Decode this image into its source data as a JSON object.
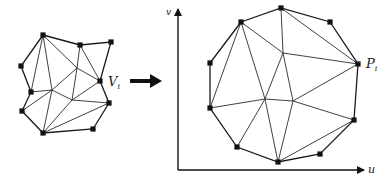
{
  "figure": {
    "left_mesh": {
      "label": "V",
      "label_sub": "i",
      "vertices": {
        "A": [
          43,
          35
        ],
        "B": [
          80,
          45
        ],
        "C": [
          111,
          42
        ],
        "D": [
          21,
          66
        ],
        "E": [
          100,
          81
        ],
        "F": [
          31,
          92
        ],
        "G": [
          22,
          111
        ],
        "H": [
          109,
          103
        ],
        "I": [
          43,
          133
        ],
        "J": [
          93,
          129
        ]
      },
      "interior": {
        "L": [
          77,
          68
        ],
        "K": [
          52,
          90
        ],
        "M": [
          72,
          100
        ]
      },
      "boundary": [
        "A",
        "B",
        "C",
        "E",
        "H",
        "J",
        "I",
        "G",
        "F",
        "D",
        "A"
      ],
      "edges": [
        [
          "A",
          "F"
        ],
        [
          "A",
          "K"
        ],
        [
          "A",
          "L"
        ],
        [
          "L",
          "E"
        ],
        [
          "B",
          "L"
        ],
        [
          "B",
          "E"
        ],
        [
          "L",
          "K"
        ],
        [
          "L",
          "M"
        ],
        [
          "K",
          "M"
        ],
        [
          "M",
          "E"
        ],
        [
          "M",
          "H"
        ],
        [
          "F",
          "K"
        ],
        [
          "G",
          "K"
        ],
        [
          "K",
          "I"
        ],
        [
          "M",
          "I"
        ],
        [
          "I",
          "H"
        ]
      ],
      "labeled_vertex": "E"
    },
    "arrow": {
      "from": [
        130,
        81
      ],
      "to": [
        161,
        81
      ]
    },
    "right_mesh": {
      "label": "P",
      "label_sub": "i",
      "vertices": {
        "A": [
          241,
          22
        ],
        "B": [
          281,
          8
        ],
        "C": [
          330,
          22
        ],
        "P": [
          358,
          64
        ],
        "D": [
          210,
          63
        ],
        "F": [
          210,
          108
        ],
        "H": [
          354,
          120
        ],
        "G": [
          237,
          147
        ],
        "I": [
          278,
          162
        ],
        "J": [
          320,
          154
        ]
      },
      "interior": {
        "L": [
          283,
          53
        ],
        "K": [
          265,
          99
        ],
        "M": [
          293,
          101
        ]
      },
      "boundary": [
        "A",
        "B",
        "C",
        "P",
        "H",
        "J",
        "I",
        "G",
        "F",
        "D",
        "A"
      ],
      "edges": [
        [
          "A",
          "F"
        ],
        [
          "A",
          "K"
        ],
        [
          "A",
          "L"
        ],
        [
          "L",
          "P"
        ],
        [
          "B",
          "L"
        ],
        [
          "B",
          "P"
        ],
        [
          "L",
          "K"
        ],
        [
          "L",
          "M"
        ],
        [
          "K",
          "M"
        ],
        [
          "M",
          "P"
        ],
        [
          "M",
          "H"
        ],
        [
          "F",
          "K"
        ],
        [
          "G",
          "K"
        ],
        [
          "K",
          "I"
        ],
        [
          "M",
          "I"
        ],
        [
          "I",
          "H"
        ]
      ],
      "labeled_vertex": "P"
    },
    "axes": {
      "origin": [
        178,
        170
      ],
      "x_end": [
        364,
        170
      ],
      "y_end": [
        178,
        9
      ],
      "x_label": "u",
      "y_label": "v"
    }
  }
}
